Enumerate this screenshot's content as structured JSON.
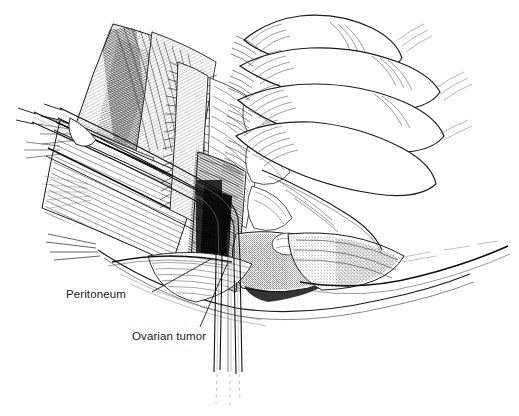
{
  "figure": {
    "domain": "medical-surgical-illustration",
    "title_visible": "",
    "background_color": "#ffffff",
    "ink_color": "#1a1a1a",
    "width": 519,
    "height": 416,
    "technique": "pen-and-ink line hatching",
    "labels": [
      {
        "id": "peritoneum",
        "text": "Peritoneum",
        "x": 66,
        "y": 289,
        "leader": {
          "from_x": 152,
          "from_y": 292,
          "to_x": 213,
          "to_y": 258
        }
      },
      {
        "id": "ovarian-tumor",
        "text": "Ovarian tumor",
        "x": 132,
        "y": 331,
        "leader": {
          "from_x": 200,
          "from_y": 327,
          "to_x": 228,
          "to_y": 262
        }
      }
    ],
    "elements": [
      {
        "name": "gloved-hand",
        "description": "Surgeon's gloved hand, four fingers, upper right of image"
      },
      {
        "name": "retractor-blades",
        "description": "Two long retractor shafts descending to the bottom center"
      },
      {
        "name": "abdominal-wall",
        "description": "Layered abdominal wall with muscle hatching at upper left"
      },
      {
        "name": "incision-cavity",
        "description": "Dark shaded incision cavity at center"
      },
      {
        "name": "peritoneum-edge",
        "description": "Thin peritoneal membrane edge crossing lower center"
      },
      {
        "name": "ovarian-tumor-mass",
        "description": "Stippled rounded tumor mass in the incision"
      }
    ]
  }
}
